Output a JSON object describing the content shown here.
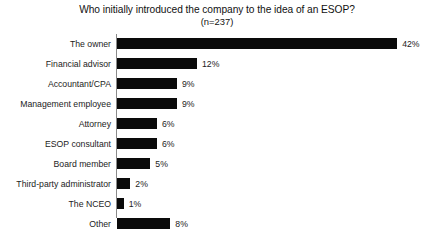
{
  "chart_data": {
    "type": "bar",
    "orientation": "horizontal",
    "title": "Who initially introduced the company to the idea of an ESOP?",
    "subtitle": "(n=237)",
    "xlabel": "",
    "ylabel": "",
    "xlim": [
      0,
      42
    ],
    "grid": false,
    "legend": null,
    "sample_size": 237,
    "value_suffix": "%",
    "bar_color": "#0a0a0a",
    "categories": [
      "The owner",
      "Financial advisor",
      "Accountant/CPA",
      "Management employee",
      "Attorney",
      "ESOP consultant",
      "Board member",
      "Third-party administrator",
      "The NCEO",
      "Other"
    ],
    "values": [
      42,
      12,
      9,
      9,
      6,
      6,
      5,
      2,
      1,
      8
    ],
    "value_labels": [
      "42%",
      "12%",
      "9%",
      "9%",
      "6%",
      "6%",
      "5%",
      "2%",
      "1%",
      "8%"
    ]
  }
}
